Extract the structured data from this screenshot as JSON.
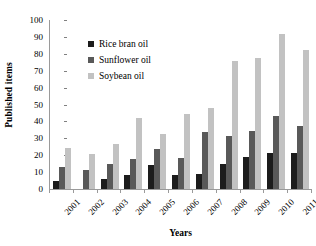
{
  "chart_data": {
    "type": "bar",
    "title": "",
    "xlabel": "Years",
    "ylabel": "Published items",
    "categories": [
      "2001",
      "2002",
      "2003",
      "2004",
      "2005",
      "2006",
      "2007",
      "2008",
      "2009",
      "2010",
      "2011"
    ],
    "series": [
      {
        "name": "Rice bran oil",
        "color": "#1c1c1c",
        "values": [
          5,
          0,
          6,
          8,
          14,
          8,
          9,
          15,
          19,
          21.5,
          21.5
        ]
      },
      {
        "name": "Sunflower oil",
        "color": "#595959",
        "values": [
          13,
          11,
          15,
          18,
          23.5,
          18.5,
          33.5,
          31.5,
          34.5,
          43,
          37.5
        ]
      },
      {
        "name": "Soybean oil",
        "color": "#c2c2c2",
        "values": [
          24.5,
          20.5,
          26.5,
          42,
          32.5,
          44.5,
          48,
          75.5,
          77.5,
          92,
          82
        ]
      }
    ],
    "ylim": [
      0,
      100
    ],
    "y_ticks": [
      0,
      10,
      20,
      30,
      40,
      50,
      60,
      70,
      80,
      90,
      100
    ],
    "grid": false,
    "legend_position": "upper-left-inside"
  }
}
